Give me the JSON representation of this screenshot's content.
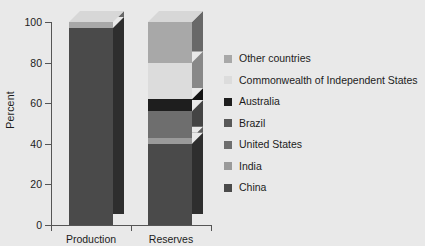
{
  "chart_data": {
    "type": "bar",
    "subtype": "stacked-3d-column",
    "title": "",
    "xlabel": "",
    "ylabel": "Percent",
    "ylim": [
      0,
      100
    ],
    "yticks": [
      0,
      20,
      40,
      60,
      80,
      100
    ],
    "ytick_labels": [
      "0",
      "20",
      "40",
      "60",
      "80",
      "100"
    ],
    "grid": false,
    "legend_position": "right",
    "categories": [
      "Production",
      "Reserves"
    ],
    "series": [
      {
        "name": "China",
        "color": "#4a4a4a",
        "values": [
          97,
          40
        ]
      },
      {
        "name": "India",
        "color": "#9a9a9a",
        "values": [
          0,
          3
        ]
      },
      {
        "name": "United States",
        "color": "#6e6e6e",
        "values": [
          0,
          13
        ]
      },
      {
        "name": "Brazil",
        "color": "#585858",
        "values": [
          0,
          0
        ]
      },
      {
        "name": "Australia",
        "color": "#1e1e1e",
        "values": [
          0,
          6
        ]
      },
      {
        "name": "Commonwealth of Independent States",
        "color": "#dcdcdc",
        "values": [
          0,
          18
        ]
      },
      {
        "name": "Other countries",
        "color": "#a8a8a8",
        "values": [
          3,
          20
        ]
      }
    ],
    "legend_entries": [
      {
        "label": "Other countries",
        "color": "#a8a8a8"
      },
      {
        "label": "Commonwealth of Independent States",
        "color": "#dcdcdc"
      },
      {
        "label": "Australia",
        "color": "#1e1e1e"
      },
      {
        "label": "Brazil",
        "color": "#585858"
      },
      {
        "label": "United States",
        "color": "#6e6e6e"
      },
      {
        "label": "India",
        "color": "#9a9a9a"
      },
      {
        "label": "China",
        "color": "#4a4a4a"
      }
    ]
  },
  "colors": {
    "background": "#e9e9e9",
    "axis": "#555555",
    "text": "#1c1c1c"
  }
}
